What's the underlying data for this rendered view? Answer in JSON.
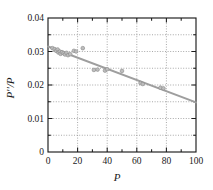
{
  "chart_data": {
    "type": "scatter",
    "title": "",
    "xlabel": "P",
    "ylabel": "P''/P",
    "xlim": [
      0,
      100
    ],
    "ylim": [
      0,
      0.04
    ],
    "grid": true,
    "legend": null,
    "x_ticks": [
      0,
      20,
      40,
      60,
      80,
      100
    ],
    "x_tick_labels": [
      "0",
      "20",
      "40",
      "60",
      "80",
      "100"
    ],
    "x_minor_ticks": [
      10,
      30,
      50,
      70,
      90
    ],
    "y_ticks": [
      0,
      0.01,
      0.02,
      0.03,
      0.04
    ],
    "y_tick_labels": [
      "0",
      "0.01",
      "0.02",
      "0.03",
      "0.04"
    ],
    "y_minor_ticks": [
      0.005,
      0.015,
      0.025,
      0.035
    ],
    "x_gridlines": [
      20,
      40,
      60,
      80
    ],
    "y_gridlines": [
      0.005,
      0.01,
      0.015,
      0.02,
      0.025,
      0.03,
      0.035
    ],
    "colors": {
      "marker_fill": "#bdbdbd",
      "marker_edge": "#8a8a8a",
      "trend_line": "#9e9e9e",
      "axis": "#1c1c1c",
      "grid": "#8c8c8c",
      "background": "#ffffff"
    },
    "series": [
      {
        "name": "data",
        "marker": "circle",
        "points": [
          [
            3.0,
            0.031
          ],
          [
            4.5,
            0.0307
          ],
          [
            5.5,
            0.0302
          ],
          [
            6.5,
            0.0306
          ],
          [
            7.0,
            0.0297
          ],
          [
            8.0,
            0.03
          ],
          [
            8.5,
            0.0293
          ],
          [
            9.5,
            0.0298
          ],
          [
            10.5,
            0.0295
          ],
          [
            11.5,
            0.0291
          ],
          [
            12.5,
            0.0296
          ],
          [
            13.5,
            0.0289
          ],
          [
            15.0,
            0.0292
          ],
          [
            17.5,
            0.0302
          ],
          [
            19.0,
            0.03
          ],
          [
            23.5,
            0.031
          ],
          [
            31.0,
            0.0245
          ],
          [
            33.5,
            0.0246
          ],
          [
            38.5,
            0.0243
          ],
          [
            40.0,
            0.0247
          ],
          [
            50.0,
            0.0242
          ],
          [
            62.5,
            0.0206
          ],
          [
            64.0,
            0.0203
          ],
          [
            76.0,
            0.0192
          ],
          [
            78.0,
            0.019
          ]
        ]
      }
    ],
    "trend_line": {
      "name": "linear fit",
      "x_start": 0,
      "y_start": 0.0315,
      "x_end": 100,
      "y_end": 0.0148,
      "slope": -0.000167,
      "intercept": 0.0315
    }
  }
}
